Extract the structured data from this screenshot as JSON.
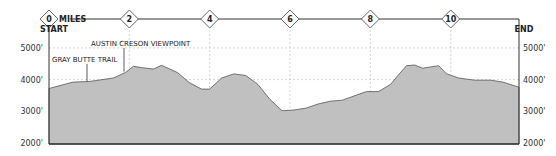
{
  "chart_data": {
    "type": "area",
    "title": "",
    "xlabel": "MILES",
    "ylabel": "",
    "x_ticks": [
      "0",
      "2",
      "4",
      "6",
      "8",
      "10"
    ],
    "y_ticks": [
      "2000'",
      "3000'",
      "4000'",
      "5000'"
    ],
    "ylim": [
      2000,
      5500
    ],
    "xlim": [
      0,
      11.7
    ],
    "start_label": "START",
    "end_label": "END",
    "grid": true,
    "annotations": [
      {
        "label": "GRAY BUTTE TRAIL",
        "mile": 1.0
      },
      {
        "label": "AUSTIN CRESON VIEWPOINT",
        "mile": 2.05
      }
    ],
    "x": [
      0,
      0.6,
      1.0,
      1.6,
      1.9,
      2.1,
      2.3,
      2.6,
      2.8,
      3.2,
      3.5,
      3.8,
      4.0,
      4.3,
      4.6,
      4.9,
      5.2,
      5.5,
      5.8,
      6.1,
      6.4,
      6.7,
      7.0,
      7.3,
      7.9,
      8.2,
      8.5,
      8.7,
      8.9,
      9.1,
      9.3,
      9.5,
      9.7,
      9.9,
      10.2,
      10.6,
      11.0,
      11.3,
      11.7
    ],
    "values": [
      3720,
      3920,
      3940,
      4050,
      4220,
      4420,
      4380,
      4330,
      4450,
      4220,
      3900,
      3700,
      3700,
      4050,
      4180,
      4130,
      3850,
      3380,
      3020,
      3040,
      3100,
      3230,
      3320,
      3350,
      3620,
      3620,
      3850,
      4150,
      4440,
      4460,
      4360,
      4400,
      4440,
      4180,
      4050,
      3980,
      3980,
      3920,
      3760
    ]
  },
  "labels": {
    "miles": "MILES",
    "start": "START",
    "end": "END",
    "gray_butte": "GRAY BUTTE TRAIL",
    "austin": "AUSTIN CRESON VIEWPOINT"
  },
  "colors": {
    "fill": "#c0c0c0",
    "stroke": "#555555",
    "axis": "#333333",
    "grid": "#cccccc"
  }
}
